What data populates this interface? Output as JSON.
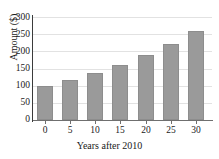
{
  "chart_data": {
    "type": "bar",
    "title": "",
    "xlabel": "Years after 2010",
    "ylabel": "Amount ($)",
    "categories": [
      "0",
      "5",
      "10",
      "15",
      "20",
      "25",
      "30"
    ],
    "values": [
      100,
      117,
      136,
      160,
      189,
      221,
      260
    ],
    "xlim": [
      -2.5,
      32.5
    ],
    "ylim": [
      0,
      300
    ],
    "ytick_labels": [
      "0",
      "50",
      "100",
      "150",
      "200",
      "250",
      "300"
    ],
    "ytick_values": [
      0,
      50,
      100,
      150,
      200,
      250,
      300
    ],
    "xtick_labels": [
      "0",
      "5",
      "10",
      "15",
      "20",
      "25",
      "30"
    ],
    "xtick_values": [
      0,
      5,
      10,
      15,
      20,
      25,
      30
    ],
    "grid": "horizontal",
    "legend": "none",
    "bar_color": "#9a9a9a",
    "grid_color": "#e2e2e2",
    "axis_color": "#3b3b3b"
  }
}
